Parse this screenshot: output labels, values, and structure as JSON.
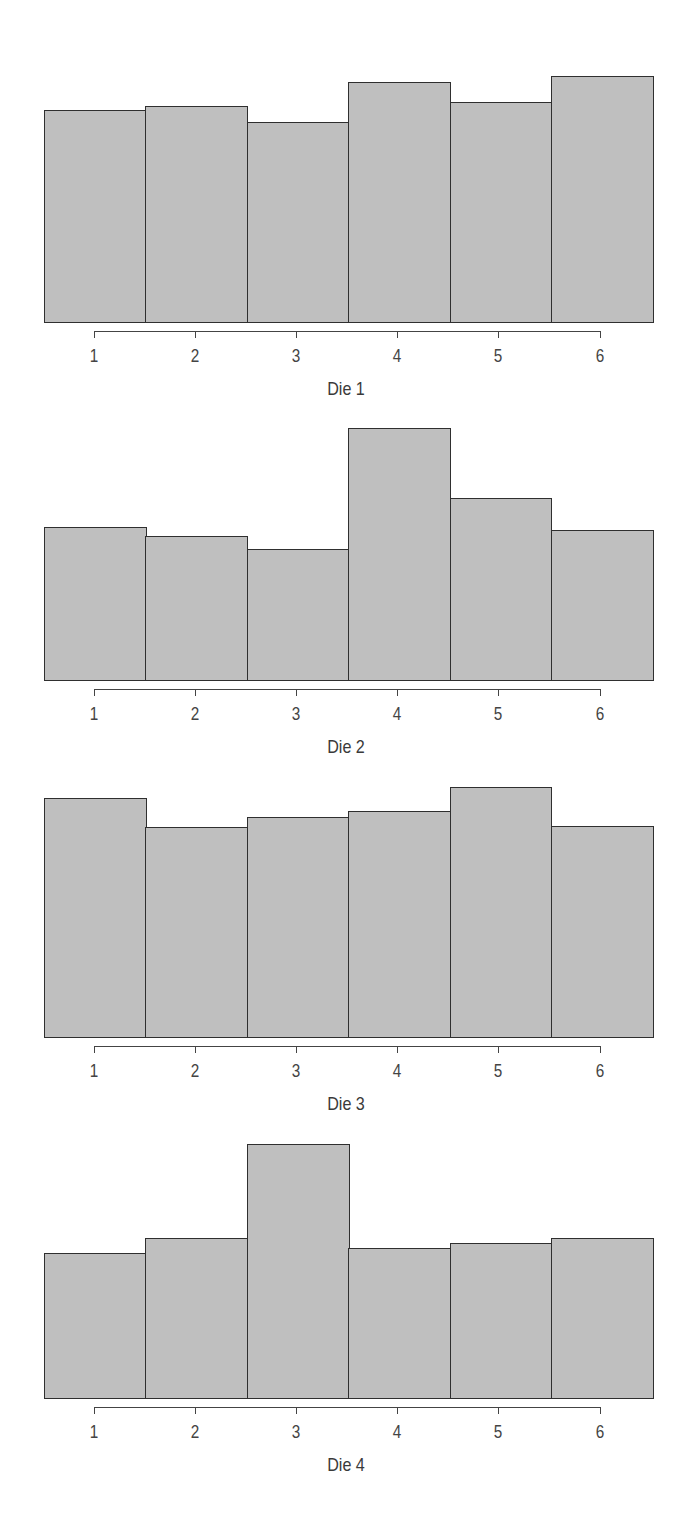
{
  "chart_data": [
    {
      "type": "bar",
      "title": "Die 1",
      "xlabel": "Die 1",
      "ylabel": "",
      "categories": [
        "1",
        "2",
        "3",
        "4",
        "5",
        "6"
      ],
      "values": [
        0.159,
        0.162,
        0.15,
        0.18,
        0.165,
        0.185
      ],
      "value_kind": "relative frequency (estimated, no y-axis shown)",
      "grid": false,
      "legend": "none",
      "bar_fill": "#bfbfbf",
      "bar_edge": "#2f2f2f"
    },
    {
      "type": "bar",
      "title": "Die 2",
      "xlabel": "Die 2",
      "ylabel": "",
      "categories": [
        "1",
        "2",
        "3",
        "4",
        "5",
        "6"
      ],
      "values": [
        0.151,
        0.142,
        0.13,
        0.249,
        0.18,
        0.148
      ],
      "value_kind": "relative frequency (estimated, no y-axis shown)",
      "grid": false,
      "legend": "none",
      "bar_fill": "#bfbfbf",
      "bar_edge": "#2f2f2f"
    },
    {
      "type": "bar",
      "title": "Die 3",
      "xlabel": "Die 3",
      "ylabel": "",
      "categories": [
        "1",
        "2",
        "3",
        "4",
        "5",
        "6"
      ],
      "values": [
        0.176,
        0.155,
        0.162,
        0.167,
        0.184,
        0.156
      ],
      "value_kind": "relative frequency (estimated, no y-axis shown)",
      "grid": false,
      "legend": "none",
      "bar_fill": "#bfbfbf",
      "bar_edge": "#2f2f2f"
    },
    {
      "type": "bar",
      "title": "Die 4",
      "xlabel": "Die 4",
      "ylabel": "",
      "categories": [
        "1",
        "2",
        "3",
        "4",
        "5",
        "6"
      ],
      "values": [
        0.142,
        0.156,
        0.248,
        0.147,
        0.151,
        0.156
      ],
      "value_kind": "relative frequency (estimated, no y-axis shown)",
      "grid": false,
      "legend": "none",
      "bar_fill": "#bfbfbf",
      "bar_edge": "#2f2f2f"
    }
  ],
  "panels": [
    {
      "label": "Die 1",
      "ticks": [
        "1",
        "2",
        "3",
        "4",
        "5",
        "6"
      ]
    },
    {
      "label": "Die 2",
      "ticks": [
        "1",
        "2",
        "3",
        "4",
        "5",
        "6"
      ]
    },
    {
      "label": "Die 3",
      "ticks": [
        "1",
        "2",
        "3",
        "4",
        "5",
        "6"
      ]
    },
    {
      "label": "Die 4",
      "ticks": [
        "1",
        "2",
        "3",
        "4",
        "5",
        "6"
      ]
    }
  ],
  "layout": {
    "bar_left": 44,
    "bar_width": 101.4,
    "tick_first_x": 93.5,
    "tick_step": 101.2,
    "panel_baselines": [
      323,
      681,
      1038,
      1399
    ],
    "px_per_unit": [
      1337,
      1018,
      1361.5,
      1030
    ]
  }
}
